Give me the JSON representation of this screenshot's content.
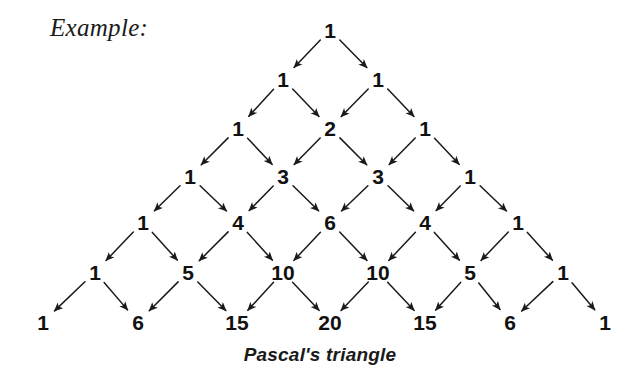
{
  "label": {
    "example": "Example:"
  },
  "caption": {
    "text": "Pascal's triangle"
  },
  "colors": {
    "background": "#ffffff",
    "text": "#111111",
    "arrow": "#1a1a1a"
  },
  "chart_data": {
    "type": "diagram",
    "title": "Pascal's triangle",
    "annotation": "Example:",
    "layout": {
      "apex_x": 330,
      "row_y": [
        30,
        79,
        128,
        176,
        222,
        272,
        322
      ],
      "x_step": 95,
      "y_step": 48
    },
    "rows": [
      {
        "index": 0,
        "values": [
          1
        ],
        "y": 30,
        "xs": [
          330
        ]
      },
      {
        "index": 1,
        "values": [
          1,
          1
        ],
        "y": 79,
        "xs": [
          283,
          378
        ]
      },
      {
        "index": 2,
        "values": [
          1,
          2,
          1
        ],
        "y": 128,
        "xs": [
          238,
          330,
          425
        ]
      },
      {
        "index": 3,
        "values": [
          1,
          3,
          3,
          1
        ],
        "y": 176,
        "xs": [
          190,
          283,
          378,
          470
        ]
      },
      {
        "index": 4,
        "values": [
          1,
          4,
          6,
          4,
          1
        ],
        "y": 222,
        "xs": [
          143,
          238,
          330,
          425,
          518
        ]
      },
      {
        "index": 5,
        "values": [
          1,
          5,
          10,
          10,
          5,
          1
        ],
        "y": 272,
        "xs": [
          95,
          188,
          283,
          378,
          470,
          563
        ]
      },
      {
        "index": 6,
        "values": [
          1,
          6,
          15,
          20,
          15,
          6,
          1
        ],
        "y": 322,
        "xs": [
          43,
          138,
          237,
          330,
          425,
          510,
          605
        ]
      }
    ]
  }
}
